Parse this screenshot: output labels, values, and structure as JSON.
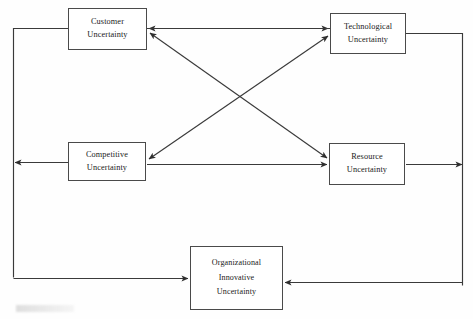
{
  "diagram": {
    "background_color": "#fefefe",
    "line_color": "#3a3a3a",
    "box_border_color": "#4a4a4a",
    "text_color": "#1a1a1a",
    "nodes": [
      {
        "id": "customer",
        "lines": [
          "Customer",
          "Uncertainty"
        ],
        "x": 68,
        "y": 8,
        "w": 79,
        "h": 42
      },
      {
        "id": "technological",
        "lines": [
          "Technological",
          "Uncertainty"
        ],
        "x": 330,
        "y": 13,
        "w": 76,
        "h": 41
      },
      {
        "id": "competitive",
        "lines": [
          "Competitive",
          "Uncertainty"
        ],
        "x": 68,
        "y": 142,
        "w": 78,
        "h": 39
      },
      {
        "id": "resource",
        "lines": [
          "Resource",
          "Uncertainty"
        ],
        "x": 329,
        "y": 143,
        "w": 76,
        "h": 42
      },
      {
        "id": "organizational",
        "lines": [
          "Organizational",
          "Innovative",
          "Uncertainty"
        ],
        "x": 190,
        "y": 246,
        "w": 93,
        "h": 64
      }
    ],
    "connectors": [
      {
        "id": "customer-technological",
        "from": "customer",
        "to": "technological",
        "style": "double-headed",
        "shape": "horizontal"
      },
      {
        "id": "competitive-resource",
        "from": "competitive",
        "to": "resource",
        "style": "single-headed",
        "shape": "horizontal"
      },
      {
        "id": "customer-resource",
        "from": "customer",
        "to": "resource",
        "style": "double-headed",
        "shape": "diagonal"
      },
      {
        "id": "technological-competitive",
        "from": "technological",
        "to": "competitive",
        "style": "double-headed",
        "shape": "diagonal"
      },
      {
        "id": "technological-competitive-outer-left",
        "from": "technological",
        "to": "competitive",
        "style": "single-headed",
        "shape": "orthogonal-left-loop"
      },
      {
        "id": "resource-outer-right",
        "from": "resource",
        "to": "organizational",
        "style": "single-headed",
        "shape": "orthogonal-right-loop"
      },
      {
        "id": "left-loop-organizational",
        "from": "left-bus",
        "to": "organizational",
        "style": "single-headed",
        "shape": "orthogonal-bottom-left"
      },
      {
        "id": "right-loop-organizational",
        "from": "right-bus",
        "to": "organizational",
        "style": "single-headed",
        "shape": "orthogonal-bottom-right"
      }
    ]
  }
}
